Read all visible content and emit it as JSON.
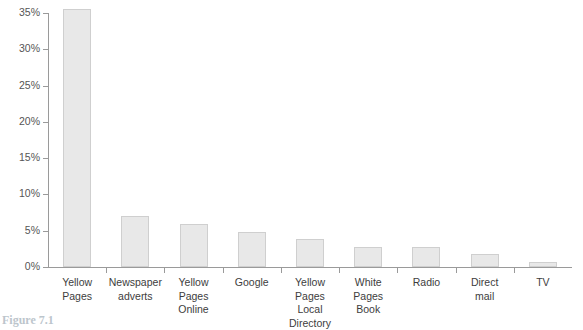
{
  "chart_data": {
    "type": "bar",
    "title": "",
    "xlabel": "",
    "ylabel": "",
    "ylim": [
      0,
      35
    ],
    "grid": false,
    "legend": "none",
    "y_tick_labels": [
      "0%",
      "5%",
      "10%",
      "15%",
      "20%",
      "25%",
      "30%",
      "35%"
    ],
    "y_ticks": [
      0,
      5,
      10,
      15,
      20,
      25,
      30,
      35
    ],
    "categories": [
      "Yellow\nPages",
      "Newspaper\nadverts",
      "Yellow Pages\nOnline",
      "Google",
      "Yellow Pages\nLocal\nDirectory",
      "White\nPages\nBook",
      "Radio",
      "Direct\nmail",
      "TV"
    ],
    "values": [
      35.5,
      7.0,
      5.9,
      4.8,
      3.9,
      2.8,
      2.8,
      1.8,
      0.7
    ],
    "bar_fill": "#e8e8e8",
    "bar_border": "#cfcfcf",
    "axis_color": "#9a9a9a"
  },
  "caption": {
    "number": "Figure 7.1",
    "text": ""
  }
}
